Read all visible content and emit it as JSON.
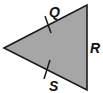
{
  "diagram": {
    "type": "triangle",
    "fill": "#a6a6a6",
    "stroke": "#1a1a1a",
    "vertices": {
      "left": [
        4,
        48
      ],
      "top_right": [
        87,
        5
      ],
      "bottom_right": [
        87,
        90
      ]
    },
    "labels": {
      "upper_side": "Q",
      "right_side": "R",
      "lower_side": "S"
    },
    "tick_marks": [
      "upper_side",
      "lower_side"
    ]
  }
}
